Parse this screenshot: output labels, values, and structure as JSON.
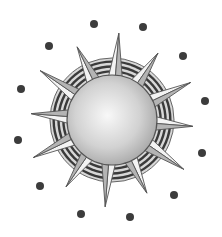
{
  "image": {
    "subject": "sun clip-art",
    "width": 222,
    "height": 237,
    "background": "#ffffff"
  },
  "sun": {
    "center": [
      112,
      120
    ],
    "core_radius": 45,
    "ring_outer_radius": 62,
    "ring_bands": 4,
    "spike_count": 12,
    "spike_length": 85,
    "colors": {
      "core_light": "#f6f6f6",
      "core_dark": "#a9a9a9",
      "outline": "#555555",
      "ring_dark": "#3a3a3a",
      "ring_light": "#d8d8d8",
      "spike_light": "#f2f2f2",
      "spike_dark": "#a0a0a0"
    }
  },
  "dots": {
    "count": 12,
    "radius": 4,
    "color": "#3c3c3c",
    "positions": [
      [
        94,
        24
      ],
      [
        143,
        27
      ],
      [
        183,
        56
      ],
      [
        205,
        101
      ],
      [
        202,
        153
      ],
      [
        174,
        195
      ],
      [
        130,
        217
      ],
      [
        81,
        214
      ],
      [
        40,
        186
      ],
      [
        18,
        140
      ],
      [
        21,
        89
      ],
      [
        49,
        46
      ]
    ]
  }
}
